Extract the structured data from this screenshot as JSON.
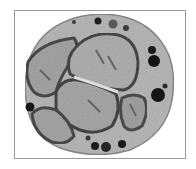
{
  "image": {
    "subject": "electron micrograph of a cell with multi-lobed nucleus",
    "style": "grayscale",
    "colors": {
      "background": "#ffffff",
      "frame": "#9a9a9a",
      "cytoplasm": "#b4b4b4",
      "nucleus_fill": "#a8a8a8",
      "nucleus_edge": "#4a4a4a",
      "granule": "#1e1e1e"
    }
  }
}
